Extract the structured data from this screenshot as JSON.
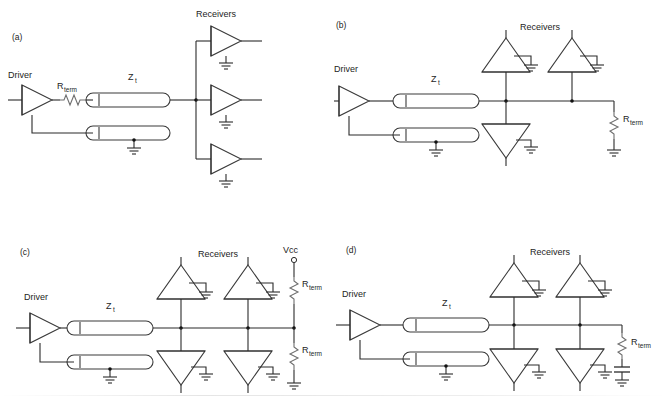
{
  "figure": {
    "background": "#ffffff",
    "line_color": "#2b2b2b"
  },
  "labels": {
    "driver": "Driver",
    "receivers": "Receivers",
    "impedance": "Z",
    "impedance_sub": "t",
    "resistor": "R",
    "resistor_sub": "term",
    "supply": "Vcc"
  },
  "panels": [
    {
      "id": "a",
      "tag": "(a)",
      "driver_label": "Driver",
      "receivers_label": "Receivers",
      "impedance_label": "Z",
      "impedance_sub": "t",
      "series_resistor_label": "R",
      "series_resistor_sub": "term",
      "termination": "series-source",
      "receiver_count": 3,
      "receiver_orientation": "right"
    },
    {
      "id": "b",
      "tag": "(b)",
      "driver_label": "Driver",
      "receivers_label": "Receivers",
      "impedance_label": "Z",
      "impedance_sub": "t",
      "end_resistor_label": "R",
      "end_resistor_sub": "term",
      "termination": "parallel-end",
      "receiver_count": 3,
      "receiver_orientation": "vertical"
    },
    {
      "id": "c",
      "tag": "(c)",
      "driver_label": "Driver",
      "receivers_label": "Receivers",
      "impedance_label": "Z",
      "impedance_sub": "t",
      "supply_label": "Vcc",
      "pullup_resistor_label": "R",
      "pullup_resistor_sub": "term",
      "pulldown_resistor_label": "R",
      "pulldown_resistor_sub": "term",
      "termination": "thevenin",
      "receiver_count": 4,
      "receiver_orientation": "vertical"
    },
    {
      "id": "d",
      "tag": "(d)",
      "driver_label": "Driver",
      "receivers_label": "Receivers",
      "impedance_label": "Z",
      "impedance_sub": "t",
      "end_resistor_label": "R",
      "end_resistor_sub": "term",
      "termination": "ac-rc",
      "receiver_count": 4,
      "receiver_orientation": "vertical"
    }
  ]
}
